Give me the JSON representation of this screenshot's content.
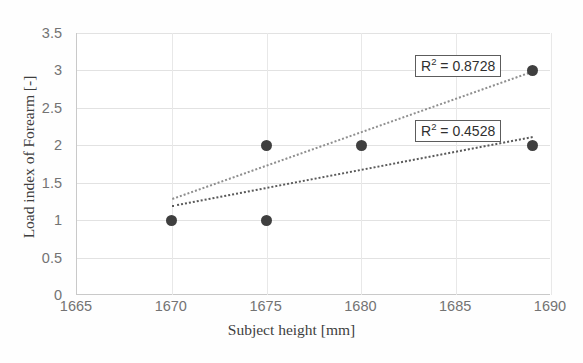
{
  "chart_data": {
    "type": "scatter",
    "title": "",
    "xlabel": "Subject height [mm]",
    "ylabel": "Load index of Forearm [-]",
    "xlim": [
      1665,
      1690
    ],
    "ylim": [
      0,
      3.5
    ],
    "xticks": [
      "1665",
      "1670",
      "1675",
      "1680",
      "1685",
      "1690"
    ],
    "xtick_values": [
      1665,
      1670,
      1675,
      1680,
      1685,
      1690
    ],
    "yticks": [
      "0",
      "0.5",
      "1",
      "1.5",
      "2",
      "2.5",
      "3",
      "3.5"
    ],
    "ytick_values": [
      0,
      0.5,
      1,
      1.5,
      2,
      2.5,
      3,
      3.5
    ],
    "grid": "horizontal-and-vertical",
    "legend": "none",
    "series": [
      {
        "name": "Load index of forearm",
        "marker": "filled-circle",
        "color": "#3f3f3f",
        "points": [
          {
            "x": 1670,
            "y": 1
          },
          {
            "x": 1675,
            "y": 1
          },
          {
            "x": 1675,
            "y": 2
          },
          {
            "x": 1680,
            "y": 2
          },
          {
            "x": 1689,
            "y": 3
          },
          {
            "x": 1689,
            "y": 2
          }
        ]
      }
    ],
    "trendlines": [
      {
        "name": "upper-trendline",
        "style": "dotted",
        "color": "#8f8f8f",
        "x_start": 1670,
        "y_start": 1.3,
        "x_end": 1689,
        "y_end": 3.0,
        "r_squared": "0.8728",
        "label": "R² = 0.8728"
      },
      {
        "name": "lower-trendline",
        "style": "dotted",
        "color": "#5a5a5a",
        "x_start": 1670,
        "y_start": 1.2,
        "x_end": 1689,
        "y_end": 2.12,
        "r_squared": "0.4528",
        "label": "R² = 0.4528"
      }
    ],
    "annotations": [
      {
        "name": "r2-label-upper",
        "text_prefix": "R",
        "text_sup": "2",
        "text_rest": " = 0.8728"
      },
      {
        "name": "r2-label-lower",
        "text_prefix": "R",
        "text_sup": "2",
        "text_rest": " = 0.4528"
      }
    ]
  },
  "axis": {
    "x_title": "Subject height [mm]",
    "y_title": "Load index of Forearm [-]"
  },
  "labels": {
    "r2_upper_prefix": "R",
    "r2_upper_sup": "2",
    "r2_upper_rest": " = 0.8728",
    "r2_lower_prefix": "R",
    "r2_lower_sup": "2",
    "r2_lower_rest": " = 0.4528"
  },
  "caption": {
    "fragment": ""
  }
}
